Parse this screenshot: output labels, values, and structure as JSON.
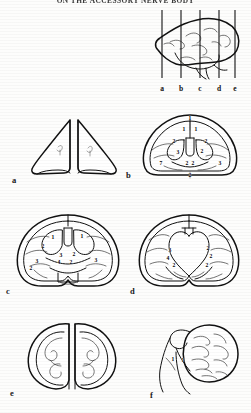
{
  "page": {
    "running_head": "ON THE ACCESSORY NERVE BODY",
    "background_color": "#fdfdfc",
    "ink_color": "#111111"
  },
  "key_diagram": {
    "name": "lateral-brain-with-section-planes",
    "plane_labels": [
      "a",
      "b",
      "c",
      "d",
      "e"
    ]
  },
  "panels": [
    {
      "letter": "a",
      "caption": "a",
      "description": "paired wing-shaped frontal pole sections",
      "callouts": []
    },
    {
      "letter": "b",
      "caption": "b",
      "description": "coronal section through anterior commissure",
      "callouts": [
        {
          "label": "1",
          "x": 50,
          "y": 9
        },
        {
          "label": "1",
          "x": 45,
          "y": 21
        },
        {
          "label": "1",
          "x": 55,
          "y": 21
        },
        {
          "label": "2",
          "x": 32,
          "y": 41
        },
        {
          "label": "2",
          "x": 68,
          "y": 41
        },
        {
          "label": "3",
          "x": 37,
          "y": 52
        },
        {
          "label": "2",
          "x": 63,
          "y": 52
        },
        {
          "label": "7",
          "x": 20,
          "y": 63
        },
        {
          "label": "2",
          "x": 47,
          "y": 64
        },
        {
          "label": "2",
          "x": 53,
          "y": 64
        },
        {
          "label": "3",
          "x": 80,
          "y": 63
        },
        {
          "label": "2",
          "x": 50,
          "y": 77
        }
      ]
    },
    {
      "letter": "c",
      "caption": "c",
      "description": "coronal section through thalamus and internal capsule",
      "callouts": [
        {
          "label": "1",
          "x": 36,
          "y": 33
        },
        {
          "label": "1",
          "x": 63,
          "y": 32
        },
        {
          "label": "2",
          "x": 27,
          "y": 45
        },
        {
          "label": "3",
          "x": 44,
          "y": 56
        },
        {
          "label": "2",
          "x": 56,
          "y": 55
        },
        {
          "label": "3",
          "x": 21,
          "y": 64
        },
        {
          "label": "4",
          "x": 42,
          "y": 65
        },
        {
          "label": "2",
          "x": 53,
          "y": 65
        },
        {
          "label": "3",
          "x": 76,
          "y": 62
        },
        {
          "label": "2",
          "x": 16,
          "y": 72
        }
      ]
    },
    {
      "letter": "d",
      "caption": "d",
      "description": "coronal section through posterior ventricle",
      "callouts": [
        {
          "label": "3",
          "x": 32,
          "y": 50
        },
        {
          "label": "2",
          "x": 68,
          "y": 48
        },
        {
          "label": "4",
          "x": 30,
          "y": 60
        },
        {
          "label": "2",
          "x": 71,
          "y": 58
        },
        {
          "label": "2",
          "x": 36,
          "y": 69
        },
        {
          "label": "2",
          "x": 67,
          "y": 69
        }
      ]
    },
    {
      "letter": "e",
      "caption": "e",
      "description": "occipital coronal section, paired lobes",
      "callouts": []
    },
    {
      "letter": "f",
      "caption": "f",
      "description": "sagittal section of cerebellum and brainstem",
      "callouts": [
        {
          "label": "1",
          "x": 27,
          "y": 56
        },
        {
          "label": "1",
          "x": 36,
          "y": 57
        }
      ]
    }
  ]
}
